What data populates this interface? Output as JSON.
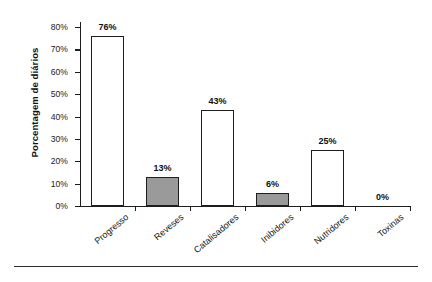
{
  "chart_data": {
    "type": "bar",
    "title": "",
    "xlabel": "",
    "ylabel": "Porcentagem de diários",
    "categories": [
      "Progresso",
      "Reveses",
      "Catalisadores",
      "Inibidores",
      "Nutridores",
      "Toxinas"
    ],
    "values": [
      76,
      13,
      43,
      6,
      25,
      0
    ],
    "value_labels": [
      "76%",
      "13%",
      "43%",
      "6%",
      "25%",
      "0%"
    ],
    "series": [
      {
        "name": "Porcentagem de diários",
        "values": [
          76,
          13,
          43,
          6,
          25,
          0
        ]
      }
    ],
    "bar_fills": [
      "white",
      "gray",
      "white",
      "gray",
      "white",
      "none"
    ],
    "ylim": [
      0,
      80
    ],
    "yticks": [
      0,
      10,
      20,
      30,
      40,
      50,
      60,
      70,
      80
    ],
    "ytick_labels": [
      "0%",
      "10%",
      "20%",
      "30%",
      "40%",
      "50%",
      "60%",
      "70%",
      "80%"
    ],
    "grid": false,
    "legend": null,
    "colors": {
      "bar_gray": "#9a9a9a",
      "bar_white": "#ffffff",
      "outline": "#1d1d1d",
      "text": "#141414"
    }
  }
}
